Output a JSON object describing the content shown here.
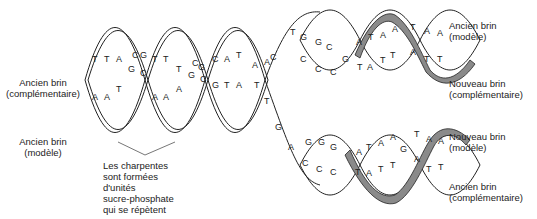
{
  "colors": {
    "strand_line": "#222222",
    "new_strand_fill": "#8a8a8a",
    "background": "#ffffff",
    "text": "#222222"
  },
  "labels": {
    "left_top": {
      "line1": "Ancien brin",
      "line2": "(complémentaire)"
    },
    "left_bottom": {
      "line1": "Ancien brin",
      "line2": "(modèle)"
    },
    "backbone_note": {
      "line1": "Les charpentes",
      "line2": "sont formées",
      "line3": "d'unités",
      "line4": "sucre-phosphate",
      "line5": "qui se répètent"
    },
    "right_top_old": {
      "line1": "Ancien brin",
      "line2": "(modèle)"
    },
    "right_top_new": {
      "line1": "Nouveau brin",
      "line2": "(complémentaire)"
    },
    "right_bottom_new": {
      "line1": "Nouveau brin",
      "line2": "(modèle)"
    },
    "right_bottom_old": {
      "line1": "Ancien brin",
      "line2": "(complémentaire)"
    }
  },
  "bases": {
    "parent_top": [
      "T",
      "T",
      "A",
      "C",
      "G",
      "T",
      "T",
      "T",
      "C",
      "G",
      "C",
      "A",
      "A",
      "A"
    ],
    "parent_bottom": [
      "A",
      "A",
      "T",
      "G",
      "C",
      "A",
      "A",
      "A",
      "G",
      "C",
      "G",
      "T",
      "T",
      "T"
    ],
    "fork_top": [
      "T",
      "G",
      "G",
      "C",
      "C",
      "A",
      "T",
      "A",
      "A",
      "T",
      "A",
      "A"
    ],
    "fork_top_old_mid": [
      "C",
      "C",
      "C",
      "C",
      "G",
      "T",
      "A",
      "T",
      "T",
      "T",
      "T"
    ],
    "fork_bottom": [
      "G",
      "A",
      "G",
      "G",
      "G",
      "C",
      "C",
      "C",
      "A",
      "T",
      "A",
      "A",
      "T",
      "T",
      "G",
      "A",
      "A"
    ]
  }
}
